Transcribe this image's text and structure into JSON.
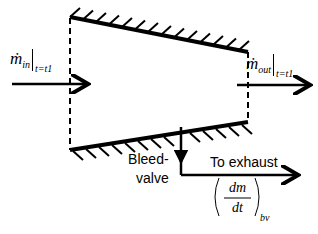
{
  "diagram": {
    "inlet": {
      "symbol": "ṁ",
      "subscript": "in",
      "eval": "t=t1"
    },
    "outlet": {
      "symbol": "ṁ",
      "subscript": "out",
      "eval": "t=t1"
    },
    "bleed": {
      "label_line1": "Bleed-",
      "label_line2": "valve"
    },
    "exhaust": {
      "label": "To exhaust"
    },
    "bleed_rate": {
      "numerator": "dm",
      "denominator": "dt",
      "subscript": "bv"
    }
  }
}
